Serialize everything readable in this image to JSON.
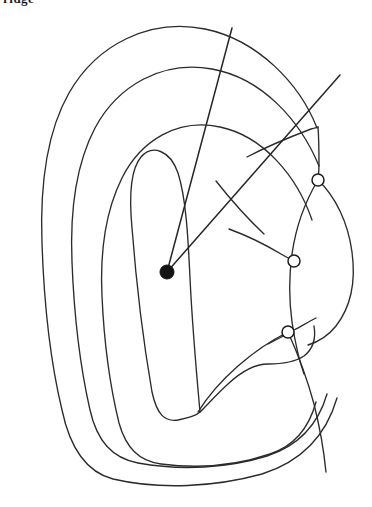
{
  "figure": {
    "title_fragment": "ridge",
    "type": "fingerprint-ridge-count-diagram",
    "background_color": "#ffffff",
    "ink_color": "#2b2b2b",
    "width": 372,
    "height": 507
  },
  "core": {
    "label": "core-point",
    "x": 167,
    "y": 272,
    "radius": 7,
    "color": "#141414"
  },
  "rays": [
    {
      "name": "ray-upper-left",
      "from_x": 167,
      "from_y": 272,
      "to_x": 232,
      "to_y": 28
    },
    {
      "name": "ray-upper-right",
      "from_x": 167,
      "from_y": 272,
      "to_x": 340,
      "to_y": 75
    }
  ],
  "markers": [
    {
      "name": "intersection-marker-1",
      "x": 318,
      "y": 180,
      "radius": 6
    },
    {
      "name": "intersection-marker-2",
      "x": 294,
      "y": 261,
      "radius": 6
    },
    {
      "name": "intersection-marker-3",
      "x": 288,
      "y": 332,
      "radius": 6
    }
  ],
  "ridges": [
    {
      "name": "ridge-outer-contour",
      "path": "M 317 128 C 300 84 258 40 205 29 C 150 18 97 44 69 93 C 45 135 40 190 42 244 C 44 302 50 360 62 410 C 70 448 86 472 113 479 C 160 490 215 487 262 474 C 300 462 326 436 337 398"
    },
    {
      "name": "ridge-second-contour",
      "path": "M 319 166 C 300 120 262 78 212 69 C 163 60 118 85 95 128 C 75 166 70 214 72 262 C 74 314 80 366 90 410 C 97 441 112 458 138 463 C 182 471 228 468 267 456 C 298 446 318 425 327 394"
    },
    {
      "name": "ridge-third-contour",
      "path": "M 312 220 C 297 176 263 136 220 127 C 178 118 141 140 122 178 C 105 212 100 254 102 296 C 104 342 110 386 119 423 C 126 448 139 461 161 464 C 199 469 238 465 270 454 C 294 446 309 428 316 402"
    },
    {
      "name": "ridge-inner-loop",
      "path": "M 200 412 C 196 368 192 320 190 278 C 188 236 186 198 178 173 C 170 150 152 144 141 157 C 130 170 129 196 132 228 C 136 280 143 340 152 392 C 157 415 165 422 178 420 C 188 418 196 416 200 412"
    },
    {
      "name": "ridge-inner-right-arm",
      "path": "M 200 412 C 208 404 218 393 228 384 C 243 370 255 364 268 364 C 282 364 295 362 304 356 C 313 349 316 338 314 326"
    },
    {
      "name": "ridge-arc-upper-right-outer",
      "path": "M 318 180 C 335 196 348 222 352 252 C 356 282 350 308 336 326 C 328 336 318 342 308 345"
    },
    {
      "name": "ridge-arc-upper-right-inner",
      "path": "M 318 180 C 306 200 296 226 292 254 C 289 276 289 300 292 322 C 295 342 299 360 304 374"
    },
    {
      "name": "ridge-ending-left-of-marker2",
      "path": "M 229 229 C 248 236 266 245 281 254 C 286 257 290 259 294 261"
    },
    {
      "name": "ridge-ending-left-of-marker3",
      "path": "M 316 318 C 308 322 300 327 294 330 C 287 334 278 339 268 344"
    },
    {
      "name": "ridge-below-marker3-arc",
      "path": "M 288 332 C 297 352 307 378 314 404 C 320 428 324 452 326 472"
    },
    {
      "name": "ridge-marker3-left-tail",
      "path": "M 288 332 C 272 340 254 352 238 366 C 222 380 208 396 198 412"
    },
    {
      "name": "ridge-bracket-upper",
      "path": "M 247 157 C 268 146 290 137 311 129 C 314 128 316 128 318 127"
    },
    {
      "name": "ridge-bracket-down",
      "path": "M 318 127 C 319 140 319 154 319 166 C 319 172 318 177 318 180"
    },
    {
      "name": "ridge-inner-diagonal",
      "path": "M 216 181 C 231 200 248 219 264 234"
    }
  ]
}
